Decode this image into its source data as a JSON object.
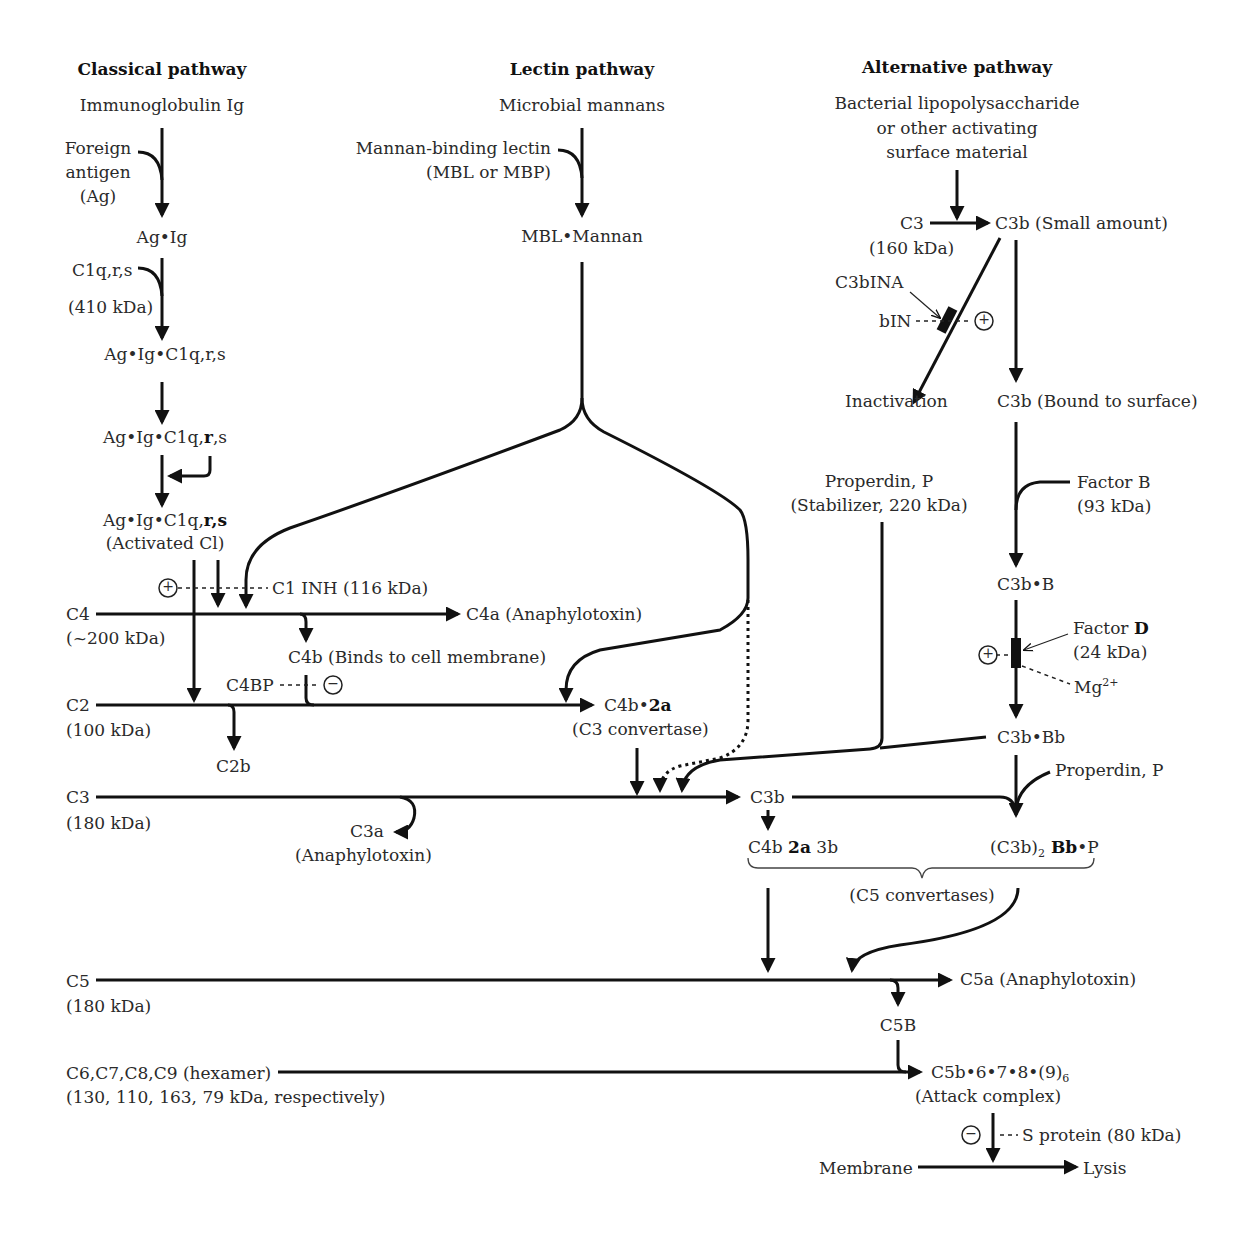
{
  "headers": {
    "classical": "Classical pathway",
    "lectin": "Lectin pathway",
    "alternative": "Alternative pathway"
  },
  "classical": {
    "start": "Immunoglobulin Ig",
    "foreign_antigen": [
      "Foreign",
      "antigen",
      "(Ag)"
    ],
    "ag_ig": "Ag•Ig",
    "c1qrs": "C1q,r,s",
    "c1qrs_mass": "(410 kDa)",
    "complex1": "Ag•Ig•C1q,r,s",
    "complex2_prefix": "Ag•Ig•C1q,",
    "complex2_bold": "r",
    "complex2_suffix": ",s",
    "complex3_prefix": "Ag•Ig•C1q,",
    "complex3_bold": "r,s",
    "activated": "(Activated Cl)",
    "c1inh": "C1 INH (116 kDa)",
    "c4": "C4",
    "c4_mass": "(~200 kDa)",
    "c4a": "C4a (Anaphylotoxin)",
    "c4b": "C4b (Binds to cell membrane)",
    "c4bp": "C4BP",
    "c2": "C2",
    "c2_mass": "(100 kDa)",
    "c2b": "C2b",
    "c4b2a_prefix": "C4b•",
    "c4b2a_bold": "2a",
    "c3_convertase": "(C3 convertase)",
    "c3": "C3",
    "c3_mass": "(180 kDa)",
    "c3a": "C3a",
    "c3a_note": "(Anaphylotoxin)"
  },
  "lectin": {
    "start": "Microbial mannans",
    "mbl": "Mannan-binding lectin",
    "mbl_alt": "(MBL or MBP)",
    "complex": "MBL•Mannan"
  },
  "alternative": {
    "start": [
      "Bacterial lipopolysaccharide",
      "or other activating",
      "surface material"
    ],
    "c3": "C3",
    "c3_mass": "(160 kDa)",
    "c3b_small": "C3b (Small amount)",
    "c3binA": "C3bINA",
    "bin": "bIN",
    "inactivation": "Inactivation",
    "c3b_bound": "C3b (Bound to surface)",
    "properdin": "Properdin, P",
    "properdin_note": "(Stabilizer, 220 kDa)",
    "factor_b": "Factor B",
    "factor_b_mass": "(93 kDa)",
    "c3b_b": "C3b•B",
    "factor_d_prefix": "Factor ",
    "factor_d_bold": "D",
    "factor_d_mass": "(24 kDa)",
    "mg": "Mg",
    "mg_sup": "2+",
    "c3b_bb": "C3b•Bb",
    "properdin2": "Properdin, P"
  },
  "convergence": {
    "c3b": "C3b",
    "c4b2a3b_a": "C4b ",
    "c4b2a3b_bold": "2a",
    "c4b2a3b_b": " 3b",
    "c3b2_prefix": "(C3b)",
    "c3b2_sub": "2",
    "c3b2_bold": " Bb",
    "c3b2_suffix": "•P",
    "c5_convertases": "(C5 convertases)",
    "c5": "C5",
    "c5_mass": "(180 kDa)",
    "c5a": "C5a (Anaphylotoxin)",
    "c5b": "C5B",
    "c6789": "C6,C7,C8,C9 (hexamer)",
    "c6789_mass": "(130, 110, 163, 79 kDa, respectively)",
    "mac_prefix": "C5b•6•7•8•(9)",
    "mac_sub": "6",
    "mac_note": "(Attack complex)",
    "s_protein": "S protein (80 kDa)",
    "membrane": "Membrane",
    "lysis": "Lysis"
  },
  "symbols": {
    "plus": "+",
    "minus": "−"
  }
}
